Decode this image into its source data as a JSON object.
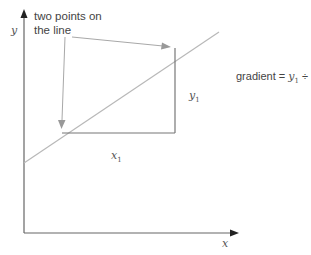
{
  "diagram": {
    "type": "gradient-of-line",
    "axes": {
      "x_label": "x",
      "y_label": "y"
    },
    "callout": {
      "line1": "two points on",
      "line2": "the line"
    },
    "labels": {
      "run": {
        "var": "x",
        "sub": "1"
      },
      "rise": {
        "var": "y",
        "sub": "1"
      },
      "formula": {
        "prefix": "gradient = ",
        "num_var": "y",
        "num_sub": "1",
        "op": " ÷ ",
        "den_var": "x",
        "den_sub": "1"
      }
    },
    "colors": {
      "axis": "#666666",
      "line": "#b5b5b5",
      "triangle": "#777777",
      "pointer": "#a0a0a0",
      "text": "#444444"
    }
  }
}
